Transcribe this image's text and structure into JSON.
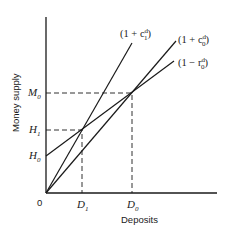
{
  "axes": {
    "x_label": "Deposits",
    "y_label": "Money supply",
    "origin_label": "0"
  },
  "y_ticks": [
    {
      "base": "M",
      "sub": "0"
    },
    {
      "base": "H",
      "sub": "1"
    },
    {
      "base": "H",
      "sub": "0"
    }
  ],
  "x_ticks": [
    {
      "base": "D",
      "sub": "1"
    },
    {
      "base": "D",
      "sub": "0"
    }
  ],
  "curves": [
    {
      "prefix": "(1 + c",
      "sub": "1",
      "sup": "d",
      "suffix": ")"
    },
    {
      "prefix": "(1 + c",
      "sub": "0",
      "sup": "d",
      "suffix": ")"
    },
    {
      "prefix": "(1 − r",
      "sub": "0",
      "sup": "d",
      "suffix": ")"
    }
  ],
  "colors": {
    "line": "#1a1a1a",
    "background": "#ffffff"
  }
}
